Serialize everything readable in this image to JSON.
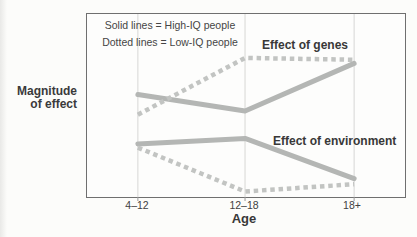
{
  "chart_data": {
    "type": "line",
    "title": "",
    "categories": [
      "4–12",
      "12–18",
      "18+"
    ],
    "xlabel": "Age",
    "ylabel": "Magnitude of effect",
    "ylabel_lines": [
      "Magnitude",
      "of effect"
    ],
    "ylim": [
      0,
      1
    ],
    "yaxis_ticks": "none (unlabeled magnitude axis)",
    "grid": "vertical gridlines at each age category",
    "legend": {
      "position": "top-left inside plot",
      "entries": [
        "Solid lines = High-IQ people",
        "Dotted lines = Low-IQ people"
      ]
    },
    "annotations": [
      {
        "text": "Effect of genes"
      },
      {
        "text": "Effect of environment"
      }
    ],
    "series": [
      {
        "name": "Effect of genes — High-IQ people",
        "line_style": "solid",
        "values": [
          0.56,
          0.47,
          0.73
        ]
      },
      {
        "name": "Effect of genes — Low-IQ people",
        "line_style": "dotted",
        "values": [
          0.45,
          0.76,
          0.75
        ]
      },
      {
        "name": "Effect of environment — High-IQ people",
        "line_style": "solid",
        "values": [
          0.29,
          0.32,
          0.1
        ]
      },
      {
        "name": "Effect of environment — Low-IQ people",
        "line_style": "dotted",
        "values": [
          0.27,
          0.03,
          0.07
        ]
      }
    ],
    "colors": {
      "solid_line": "#b4b6b4",
      "dotted_line": "#c2c4c2",
      "gridline": "#d7d7d5",
      "tick": "#9a9a9a",
      "plot_border": "#6f6f6f",
      "text": "#3c3c3c",
      "background": "#fcfcfa"
    }
  }
}
